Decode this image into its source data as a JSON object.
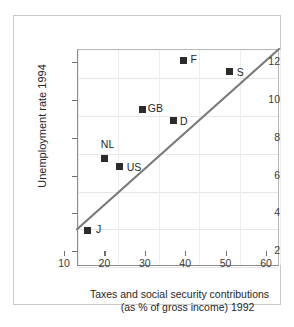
{
  "chart_data": {
    "type": "scatter",
    "title": "",
    "xlabel": "Taxes and social security contributions (as % of gross income) 1992",
    "xlabel_line1": "Taxes and social security contributions",
    "xlabel_line2": "(as % of gross income) 1992",
    "ylabel": "Unemployment rate 1994",
    "xlim": [
      10,
      60
    ],
    "ylim": [
      2,
      13.5
    ],
    "xticks": [
      10,
      20,
      30,
      40,
      50,
      60
    ],
    "yticks": [
      2,
      4,
      6,
      8,
      10,
      12
    ],
    "xtick_labels": [
      "10",
      "20",
      "30",
      "40",
      "50",
      "60"
    ],
    "ytick_labels": [
      "2",
      "4",
      "6",
      "8",
      "10",
      "12"
    ],
    "grid": true,
    "legend": "none",
    "points": [
      {
        "label": "J",
        "x": 15.7,
        "y": 3.1,
        "label_dx": 9,
        "label_dy": -6
      },
      {
        "label": "NL",
        "x": 20.1,
        "y": 6.9,
        "label_dx": -4,
        "label_dy": -20
      },
      {
        "label": "US",
        "x": 23.8,
        "y": 6.5,
        "label_dx": 7,
        "label_dy": -4
      },
      {
        "label": "GB",
        "x": 29.5,
        "y": 9.5,
        "label_dx": 5,
        "label_dy": -6
      },
      {
        "label": "D",
        "x": 37.0,
        "y": 8.9,
        "label_dx": 7,
        "label_dy": -5
      },
      {
        "label": "F",
        "x": 39.6,
        "y": 12.1,
        "label_dx": 7,
        "label_dy": -6
      },
      {
        "label": "S",
        "x": 51.0,
        "y": 11.5,
        "label_dx": 7,
        "label_dy": -5
      }
    ],
    "trend_line": {
      "name": "regression-line",
      "x_start": 10,
      "y_start": 3.95,
      "x_end": 60,
      "y_end": 13.5,
      "color": "#7a7a7a"
    },
    "colors": {
      "marker": "#2b2b2b",
      "trend": "#7a7a7a",
      "axis": "#8b8b8b",
      "grid": "#e6e6e6",
      "outer_frame": "#c9c9c9",
      "text": "#262626",
      "background": "#ffffff"
    }
  }
}
